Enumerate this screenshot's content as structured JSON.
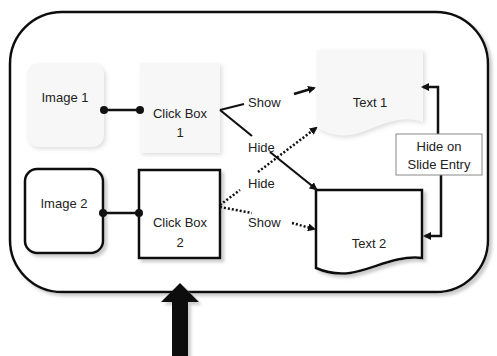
{
  "diagram": {
    "nodes": {
      "image1": {
        "label": "Image 1",
        "style": "faded"
      },
      "clickbox1": {
        "line1": "Click Box",
        "line2": "1",
        "style": "faded"
      },
      "text1": {
        "label": "Text 1",
        "shape": "document",
        "style": "faded"
      },
      "image2": {
        "label": "Image 2",
        "style": "bold"
      },
      "clickbox2": {
        "line1": "Click Box",
        "line2": "2",
        "style": "bold"
      },
      "text2": {
        "label": "Text 2",
        "shape": "document",
        "style": "bold"
      },
      "hide_on_entry": {
        "line1": "Hide on",
        "line2": "Slide Entry"
      }
    },
    "edges": [
      {
        "from": "clickbox1",
        "to": "text1",
        "label": "Show",
        "style": "solid"
      },
      {
        "from": "clickbox1",
        "to": "text2",
        "label": "Hide",
        "style": "solid"
      },
      {
        "from": "clickbox2",
        "to": "text1",
        "label": "Hide",
        "style": "dotted"
      },
      {
        "from": "clickbox2",
        "to": "text2",
        "label": "Show",
        "style": "dotted"
      },
      {
        "from": "hide_on_entry",
        "to": "text1",
        "label": "",
        "style": "solid"
      },
      {
        "from": "hide_on_entry",
        "to": "text2",
        "label": "",
        "style": "solid"
      },
      {
        "from": "image1",
        "to": "clickbox1",
        "label": "",
        "style": "connector"
      },
      {
        "from": "image2",
        "to": "clickbox2",
        "label": "",
        "style": "connector"
      }
    ],
    "edge_labels": {
      "show1": "Show",
      "hide1": "Hide",
      "hide2": "Hide",
      "show2": "Show"
    },
    "pointer": "up-arrow"
  },
  "colors": {
    "stroke": "#111111",
    "faded_fill": "#f6f6f6",
    "shadow": "#cfcfcf"
  }
}
